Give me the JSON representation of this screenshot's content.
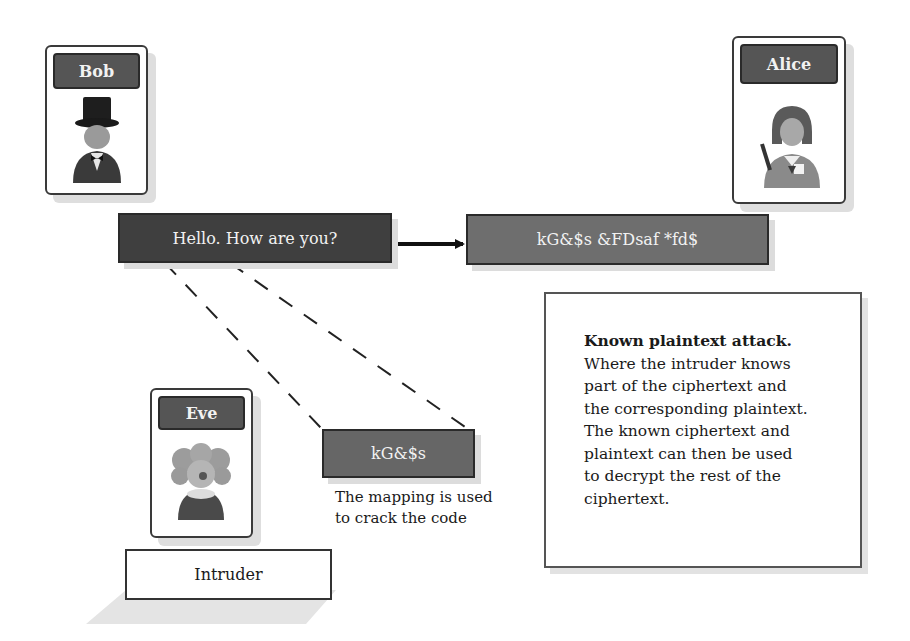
{
  "participants": {
    "bob": {
      "label": "Bob",
      "icon": "man-top-hat-icon"
    },
    "alice": {
      "label": "Alice",
      "icon": "woman-avatar-icon"
    },
    "eve": {
      "label": "Eve",
      "icon": "clown-avatar-icon",
      "role_label": "Intruder"
    }
  },
  "messages": {
    "plaintext": "Hello. How are you?",
    "ciphertext": "kG&$s &FDsaf *fd$",
    "intercepted_fragment": "kG&$s"
  },
  "caption": {
    "line1": "The mapping is used",
    "line2": "to crack the code"
  },
  "info_box": {
    "title": "Known plaintext attack.",
    "lines": [
      "Where the intruder knows",
      "part of the ciphertext and",
      "the corresponding plaintext.",
      "The known ciphertext and",
      "plaintext can then be used",
      "to decrypt the rest of the",
      "ciphertext."
    ]
  },
  "colors": {
    "plaintext_box": "#3f3f3f",
    "ciphertext_box": "#6e6e6e",
    "fragment_box": "#666666",
    "label_bar": "#555555"
  }
}
